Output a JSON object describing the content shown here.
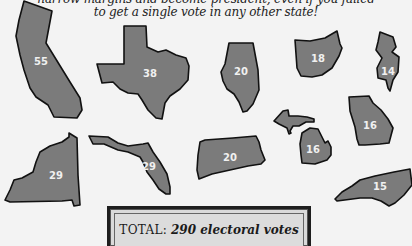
{
  "caption": {
    "line1": "narrow margins and become president, even if you failed",
    "line2": "to get a single vote in any other state!"
  },
  "colors": {
    "background": "#f3f3f3",
    "state_fill": "#7b7b7b",
    "state_outline": "#111111",
    "box_fill": "#dadada"
  },
  "states": [
    {
      "name": "California",
      "votes": "55"
    },
    {
      "name": "Texas",
      "votes": "38"
    },
    {
      "name": "Illinois",
      "votes": "20"
    },
    {
      "name": "Ohio",
      "votes": "18"
    },
    {
      "name": "New Jersey",
      "votes": "14"
    },
    {
      "name": "New York",
      "votes": "29"
    },
    {
      "name": "Florida",
      "votes": "29"
    },
    {
      "name": "Pennsylvania",
      "votes": "20"
    },
    {
      "name": "Michigan",
      "votes": "16"
    },
    {
      "name": "Georgia",
      "votes": "16"
    },
    {
      "name": "North Carolina",
      "votes": "15"
    }
  ],
  "total": {
    "label": "TOTAL:",
    "value": "290 electoral votes"
  }
}
